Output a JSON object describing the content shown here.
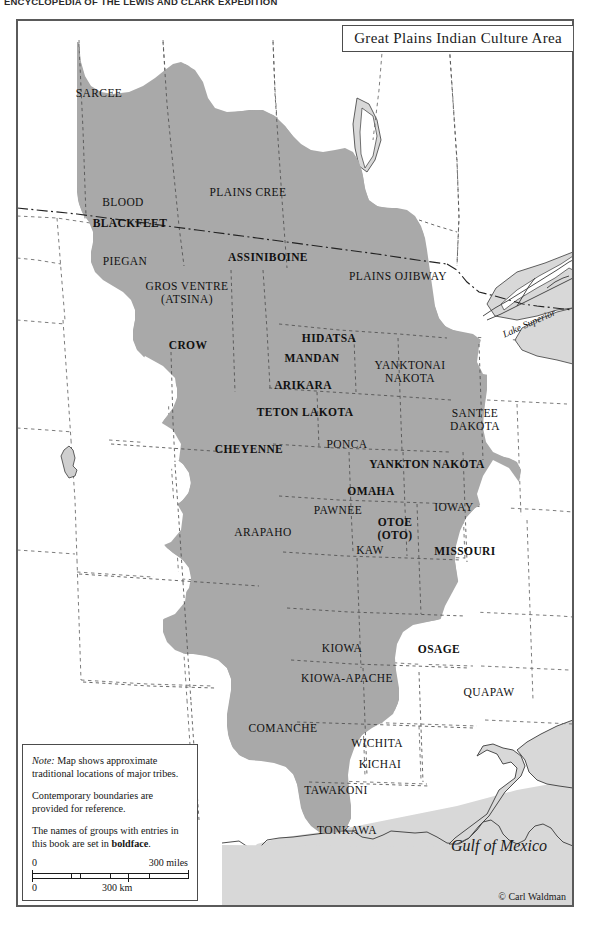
{
  "running_header": {
    "text": "ENCYCLOPEDIA OF THE LEWIS AND CLARK EXPEDITION"
  },
  "title_box": {
    "title": "Great Plains Indian Culture Area"
  },
  "colors": {
    "culture_area_fill": "#a9a9a9",
    "land_fill": "#d8d8d8",
    "water_fill": "#ffffff",
    "boundary_line": "#555555",
    "coastline": "#3a3a3a",
    "frame": "#5a5a5a",
    "text": "#111111"
  },
  "tribes": [
    {
      "name": "SARCEE",
      "bold": false,
      "x": 82,
      "y": 73,
      "lines": [
        "SARCEE"
      ]
    },
    {
      "name": "PLAINS CREE",
      "bold": false,
      "x": 231,
      "y": 172,
      "lines": [
        "PLAINS CREE"
      ]
    },
    {
      "name": "BLOOD",
      "bold": false,
      "x": 106,
      "y": 182,
      "lines": [
        "BLOOD"
      ]
    },
    {
      "name": "BLACKFEET",
      "bold": true,
      "x": 113,
      "y": 203,
      "lines": [
        "BLACKFEET"
      ]
    },
    {
      "name": "PIEGAN",
      "bold": false,
      "x": 108,
      "y": 241,
      "lines": [
        "PIEGAN"
      ]
    },
    {
      "name": "ASSINIBOINE",
      "bold": true,
      "x": 251,
      "y": 237,
      "lines": [
        "ASSINIBOINE"
      ]
    },
    {
      "name": "PLAINS OJIBWAY",
      "bold": false,
      "x": 381,
      "y": 256,
      "lines": [
        "PLAINS OJIBWAY"
      ]
    },
    {
      "name": "GROS VENTRE",
      "bold": false,
      "x": 170,
      "y": 273,
      "lines": [
        "GROS VENTRE",
        "(ATSINA)"
      ]
    },
    {
      "name": "CROW",
      "bold": true,
      "x": 171,
      "y": 325,
      "lines": [
        "CROW"
      ]
    },
    {
      "name": "HIDATSA",
      "bold": true,
      "x": 312,
      "y": 318,
      "lines": [
        "HIDATSA"
      ]
    },
    {
      "name": "MANDAN",
      "bold": true,
      "x": 295,
      "y": 338,
      "lines": [
        "MANDAN"
      ]
    },
    {
      "name": "YANKTONAI NAKOTA",
      "bold": false,
      "x": 393,
      "y": 352,
      "lines": [
        "YANKTONAI",
        "NAKOTA"
      ]
    },
    {
      "name": "ARIKARA",
      "bold": true,
      "x": 286,
      "y": 365,
      "lines": [
        "ARIKARA"
      ]
    },
    {
      "name": "TETON LAKOTA",
      "bold": true,
      "x": 288,
      "y": 392,
      "lines": [
        "TETON LAKOTA"
      ]
    },
    {
      "name": "SANTEE DAKOTA",
      "bold": false,
      "x": 458,
      "y": 400,
      "lines": [
        "SANTEE",
        "DAKOTA"
      ]
    },
    {
      "name": "CHEYENNE",
      "bold": true,
      "x": 232,
      "y": 429,
      "lines": [
        "CHEYENNE"
      ]
    },
    {
      "name": "PONCA",
      "bold": false,
      "x": 330,
      "y": 424,
      "lines": [
        "PONCA"
      ]
    },
    {
      "name": "YANKTON NAKOTA",
      "bold": true,
      "x": 410,
      "y": 444,
      "lines": [
        "YANKTON NAKOTA"
      ]
    },
    {
      "name": "OMAHA",
      "bold": true,
      "x": 354,
      "y": 471,
      "lines": [
        "OMAHA"
      ]
    },
    {
      "name": "IOWAY",
      "bold": false,
      "x": 437,
      "y": 487,
      "lines": [
        "IOWAY"
      ]
    },
    {
      "name": "PAWNEE",
      "bold": false,
      "x": 321,
      "y": 490,
      "lines": [
        "PAWNEE"
      ]
    },
    {
      "name": "ARAPAHO",
      "bold": false,
      "x": 246,
      "y": 512,
      "lines": [
        "ARAPAHO"
      ]
    },
    {
      "name": "OTOE (OTO)",
      "bold": true,
      "x": 378,
      "y": 509,
      "lines": [
        "OTOE",
        "(OTO)"
      ]
    },
    {
      "name": "KAW",
      "bold": false,
      "x": 353,
      "y": 530,
      "lines": [
        "KAW"
      ]
    },
    {
      "name": "MISSOURI",
      "bold": true,
      "x": 448,
      "y": 531,
      "lines": [
        "MISSOURI"
      ]
    },
    {
      "name": "KIOWA",
      "bold": false,
      "x": 325,
      "y": 628,
      "lines": [
        "KIOWA"
      ]
    },
    {
      "name": "OSAGE",
      "bold": true,
      "x": 422,
      "y": 629,
      "lines": [
        "OSAGE"
      ]
    },
    {
      "name": "KIOWA-APACHE",
      "bold": false,
      "x": 330,
      "y": 658,
      "lines": [
        "KIOWA-APACHE"
      ]
    },
    {
      "name": "QUAPAW",
      "bold": false,
      "x": 472,
      "y": 672,
      "lines": [
        "QUAPAW"
      ]
    },
    {
      "name": "COMANCHE",
      "bold": false,
      "x": 266,
      "y": 708,
      "lines": [
        "COMANCHE"
      ]
    },
    {
      "name": "WICHITA",
      "bold": false,
      "x": 360,
      "y": 723,
      "lines": [
        "WICHITA"
      ]
    },
    {
      "name": "KICHAI",
      "bold": false,
      "x": 363,
      "y": 744,
      "lines": [
        "KICHAI"
      ]
    },
    {
      "name": "TAWAKONI",
      "bold": false,
      "x": 319,
      "y": 770,
      "lines": [
        "TAWAKONI"
      ]
    },
    {
      "name": "TONKAWA",
      "bold": false,
      "x": 330,
      "y": 810,
      "lines": [
        "TONKAWA"
      ]
    }
  ],
  "water_labels": {
    "lake_superior": "Lake Superior",
    "gulf_of_mexico": "Gulf of Mexico"
  },
  "legend": {
    "note_word": "Note:",
    "line1": " Map shows approximate traditional locations of major tribes.",
    "line2": "Contemporary boundaries are provided for reference.",
    "line3_prefix": "The names of groups with entries in this book are set in ",
    "line3_bold": "boldface",
    "line3_suffix": ".",
    "scale_miles": {
      "zero": "0",
      "max": "300 miles"
    },
    "scale_km": {
      "zero": "0",
      "mid": "300 km"
    }
  },
  "copyright": "© Carl Waldman"
}
